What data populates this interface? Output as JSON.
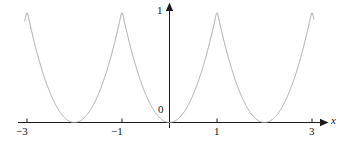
{
  "figure": {
    "background_color": "#ffffff",
    "axis_color": "#1a1a1a",
    "curve_color": "#a8a8a8"
  },
  "chart_data": {
    "type": "line",
    "title": "",
    "subtitle": "",
    "xlabel": "x",
    "ylabel": "",
    "grid": false,
    "legend": null,
    "annotations": [],
    "xlim": [
      -3.05,
      3.05
    ],
    "ylim": [
      0,
      1.05
    ],
    "x_ticks": [
      -3,
      -1,
      1,
      3
    ],
    "x_tick_labels": [
      "−3",
      "−1",
      "1",
      "3"
    ],
    "y_ticks": [
      0,
      1
    ],
    "y_tick_labels": [
      "0",
      "1"
    ],
    "origin_label": "0",
    "x_axis_arrow": true,
    "y_axis_arrow": true,
    "period": 2,
    "maxima_x": [
      -3,
      -1,
      1,
      3
    ],
    "maxima_y": 1,
    "minima_x": [
      -2,
      0,
      2
    ],
    "minima_y": 0,
    "series": [
      {
        "name": "y = periodic x^2",
        "x": [
          -3.0,
          -2.9,
          -2.8,
          -2.7,
          -2.6,
          -2.5,
          -2.4,
          -2.3,
          -2.2,
          -2.1,
          -2.0,
          -1.9,
          -1.8,
          -1.7,
          -1.6,
          -1.5,
          -1.4,
          -1.3,
          -1.2,
          -1.1,
          -1.0,
          -0.9,
          -0.8,
          -0.7,
          -0.6,
          -0.5,
          -0.4,
          -0.3,
          -0.2,
          -0.1,
          0.0,
          0.1,
          0.2,
          0.3,
          0.4,
          0.5,
          0.6,
          0.7,
          0.8,
          0.9,
          1.0,
          1.1,
          1.2,
          1.3,
          1.4,
          1.5,
          1.6,
          1.7,
          1.8,
          1.9,
          2.0,
          2.1,
          2.2,
          2.3,
          2.4,
          2.5,
          2.6,
          2.7,
          2.8,
          2.9,
          3.0
        ],
        "y": [
          1.0,
          0.81,
          0.64,
          0.49,
          0.36,
          0.25,
          0.16,
          0.09,
          0.04,
          0.01,
          0.0,
          0.01,
          0.04,
          0.09,
          0.16,
          0.25,
          0.36,
          0.49,
          0.64,
          0.81,
          1.0,
          0.81,
          0.64,
          0.49,
          0.36,
          0.25,
          0.16,
          0.09,
          0.04,
          0.01,
          0.0,
          0.01,
          0.04,
          0.09,
          0.16,
          0.25,
          0.36,
          0.49,
          0.64,
          0.81,
          1.0,
          0.81,
          0.64,
          0.49,
          0.36,
          0.25,
          0.16,
          0.09,
          0.04,
          0.01,
          0.0,
          0.01,
          0.04,
          0.09,
          0.16,
          0.25,
          0.36,
          0.49,
          0.64,
          0.81,
          1.0
        ]
      }
    ]
  },
  "labels": {
    "x_neg3": "−3",
    "x_neg1": "−1",
    "x_pos1": "1",
    "x_pos3": "3",
    "y_one": "1",
    "origin": "0",
    "x_axis": "x"
  }
}
